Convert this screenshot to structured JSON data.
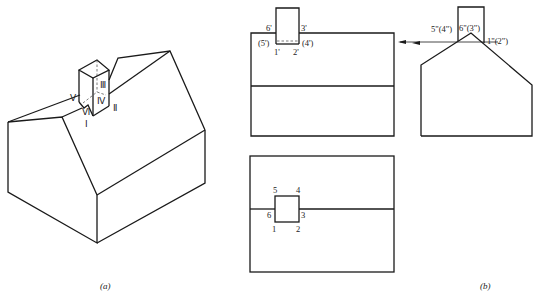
{
  "figure": {
    "panel_a": {
      "caption": "(a)",
      "labels": {
        "I": "Ⅰ",
        "II": "Ⅱ",
        "III": "Ⅲ",
        "IV": "Ⅳ",
        "V": "Ⅴ",
        "VI": "Ⅵ"
      }
    },
    "panel_b": {
      "caption": "(b)",
      "front_view_labels": {
        "p6": "6'",
        "p3": "3'",
        "p5": "(5')",
        "p4": "(4')",
        "p1": "1'",
        "p2": "2'"
      },
      "side_view_labels": {
        "p54": "5\"(4\")",
        "p63": "6\"(3\")",
        "p12": "1\"(2\")"
      },
      "top_view_labels": {
        "p5": "5",
        "p4": "4",
        "p6": "6",
        "p3": "3",
        "p1": "1",
        "p2": "2"
      }
    }
  }
}
